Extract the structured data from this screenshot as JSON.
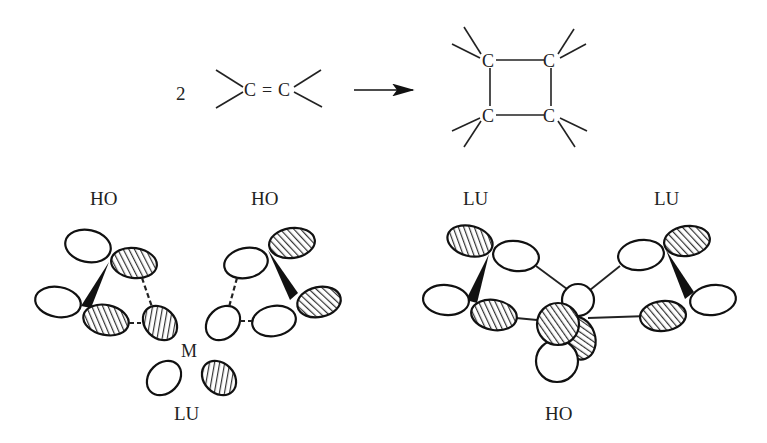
{
  "reaction": {
    "coefficient": "2",
    "reactant": {
      "atom1": "C",
      "bond": "=",
      "atom2": "C"
    },
    "arrow": "reaction-arrow",
    "product": {
      "atoms": [
        "C",
        "C",
        "C",
        "C"
      ],
      "ring": "cyclobutane"
    }
  },
  "left_diagram": {
    "labels": {
      "top_left": "HO",
      "top_right": "HO",
      "center_atom": "M",
      "bottom": "LU"
    }
  },
  "right_diagram": {
    "labels": {
      "top_left": "LU",
      "top_right": "LU",
      "bottom": "HO"
    }
  },
  "colors": {
    "ink": "#222222",
    "background": "#ffffff",
    "hatch": "#333333"
  }
}
